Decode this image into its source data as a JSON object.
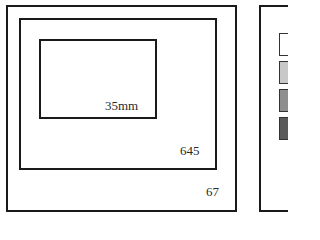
{
  "diagram": {
    "frames": [
      {
        "id": "67",
        "label": "67"
      },
      {
        "id": "645",
        "label": "645"
      },
      {
        "id": "35mm",
        "label": "35mm"
      }
    ]
  },
  "legend": {
    "swatches": [
      {
        "color": "#ffffff"
      },
      {
        "color": "#c8c8c8"
      },
      {
        "color": "#8e8e8e"
      },
      {
        "color": "#5a5a5a"
      }
    ]
  }
}
